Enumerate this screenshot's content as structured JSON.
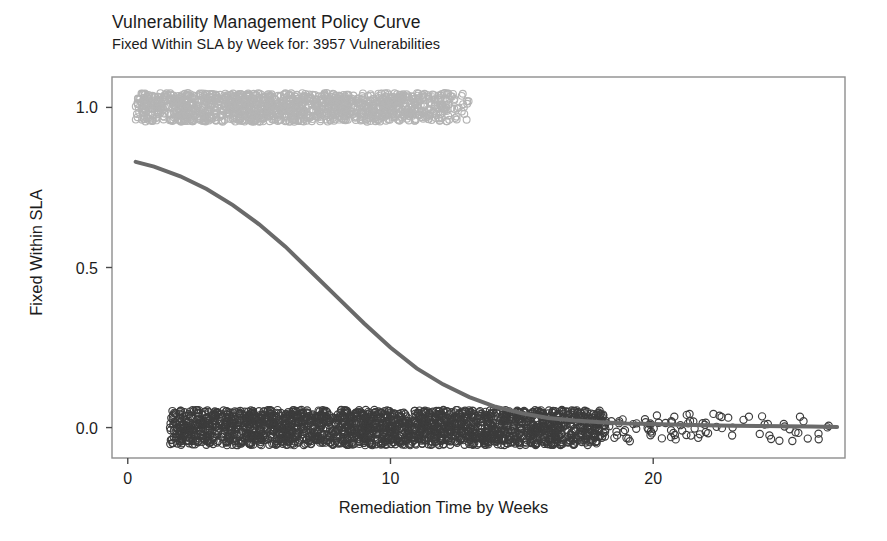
{
  "chart_data": {
    "type": "scatter",
    "title": "Vulnerability Management Policy Curve",
    "subtitle": "Fixed Within SLA by Week for: 3957 Vulnerabilities",
    "xlabel": "Remediation Time by Weeks",
    "ylabel": "Fixed Within SLA",
    "xlim": [
      -0.6,
      27.3
    ],
    "ylim": [
      -0.095,
      1.095
    ],
    "xticks": [
      0,
      10,
      20
    ],
    "xticklabels": [
      "0",
      "10",
      "20"
    ],
    "yticks": [
      0.0,
      0.5,
      1.0
    ],
    "yticklabels": [
      "0.0",
      "0.5",
      "1.0"
    ],
    "grid": false,
    "legend": null,
    "n_observations": 3957,
    "series": [
      {
        "name": "Fixed within SLA (y = 1)",
        "type": "scatter",
        "marker": "open-circle",
        "color": "#b4b4b4",
        "point_count": 1480,
        "x_range": [
          0.3,
          13.1
        ],
        "y_jitter_range": [
          0.955,
          1.045
        ],
        "density_note": "dense uniform band weeks 0.3-10.5, thinning to sparse by week 13"
      },
      {
        "name": "Not fixed within SLA (y = 0)",
        "type": "scatter",
        "marker": "open-circle",
        "color": "#3c3c3c",
        "point_count": 2477,
        "x_range": [
          1.2,
          27.0
        ],
        "y_jitter_range": [
          -0.055,
          0.055
        ],
        "density_note": "very dense band weeks 2.5-18, sparse scattered tail out to week 27"
      },
      {
        "name": "Logistic policy curve (fitted probability)",
        "type": "line",
        "color": "#6a6a6a",
        "line_width": 4,
        "x": [
          0.3,
          1,
          2,
          3,
          4,
          5,
          6,
          7,
          8,
          9,
          10,
          11,
          12,
          13,
          14,
          15,
          16,
          17,
          18,
          19,
          20,
          21,
          22,
          23,
          24,
          25,
          26,
          27
        ],
        "y": [
          0.83,
          0.815,
          0.785,
          0.745,
          0.695,
          0.635,
          0.565,
          0.485,
          0.405,
          0.325,
          0.25,
          0.185,
          0.135,
          0.095,
          0.065,
          0.045,
          0.03,
          0.022,
          0.017,
          0.013,
          0.011,
          0.009,
          0.007,
          0.006,
          0.005,
          0.004,
          0.003,
          0.002
        ]
      }
    ]
  },
  "axes": {
    "panel_color": "#ffffff",
    "border_color": "#909090",
    "tick_color": "#4a4a4a"
  }
}
